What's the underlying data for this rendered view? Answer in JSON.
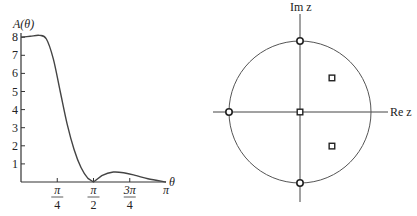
{
  "chart_data": [
    {
      "type": "line",
      "title": "",
      "ylabel": "A(θ)",
      "xlabel": "θ",
      "yticks": [
        "1",
        "2",
        "3",
        "4",
        "5",
        "6",
        "7",
        "8"
      ],
      "xticks": [
        {
          "num": "π",
          "den": "4"
        },
        {
          "num": "π",
          "den": "2"
        },
        {
          "num": "3π",
          "den": "4"
        },
        {
          "num": "π",
          "den": ""
        }
      ],
      "xlim": [
        0,
        3.1416
      ],
      "ylim": [
        0,
        8.2
      ],
      "grid": false,
      "x": [
        0,
        0.2,
        0.4,
        0.55,
        0.7,
        0.85,
        1.0,
        1.15,
        1.3,
        1.45,
        1.5708,
        1.75,
        2.0,
        2.25,
        2.5,
        2.75,
        3.1416
      ],
      "values": [
        8.0,
        8.05,
        8.1,
        7.9,
        6.8,
        5.0,
        3.2,
        1.8,
        0.8,
        0.2,
        0.0,
        0.35,
        0.55,
        0.5,
        0.35,
        0.18,
        0.0
      ]
    },
    {
      "type": "scatter",
      "title": "Pole-zero plot",
      "xlabel": "Re z",
      "ylabel": "Im z",
      "unit_circle": true,
      "zeros": [
        {
          "re": 0,
          "im": 1
        },
        {
          "re": -1,
          "im": 0
        },
        {
          "re": 0,
          "im": -1
        }
      ],
      "poles": [
        {
          "re": 0,
          "im": 0
        },
        {
          "re": 0.45,
          "im": 0.48
        },
        {
          "re": 0.45,
          "im": -0.48
        }
      ]
    }
  ],
  "labels": {
    "left_ylabel": "A(θ)",
    "left_xlabel": "θ",
    "right_im": "Im z",
    "right_re": "Re z"
  }
}
